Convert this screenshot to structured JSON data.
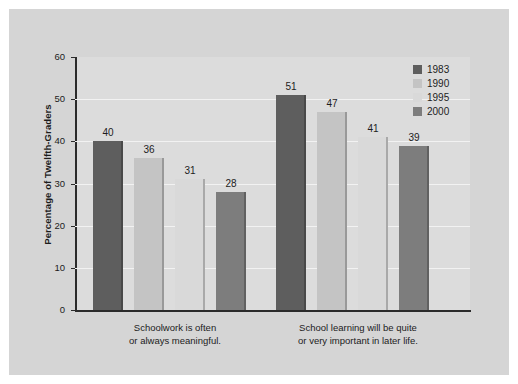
{
  "chart_data": {
    "type": "bar",
    "title": "",
    "subtitle": "",
    "xlabel": "",
    "ylabel": "Percentage of Twelfth-Graders",
    "ylim": [
      0,
      60
    ],
    "ytick_step": 10,
    "ytick_labels": [
      "60",
      "50",
      "40",
      "30",
      "20",
      "10",
      "0"
    ],
    "grid": true,
    "grid_orientation": "horizontal",
    "legend_position": "top-right",
    "categories": [
      "Schoolwork is often or always meaningful.",
      "School learning will be quite or very important in later life."
    ],
    "category_lines": [
      [
        "Schoolwork is often",
        "or always meaningful."
      ],
      [
        "School learning will be quite",
        "or very important in later life."
      ]
    ],
    "series": [
      {
        "name": "1983",
        "color": "#5e5e5e",
        "values": [
          40,
          51
        ]
      },
      {
        "name": "1990",
        "color": "#c4c4c4",
        "values": [
          36,
          47
        ]
      },
      {
        "name": "1995",
        "color": "#d9d9d9",
        "values": [
          31,
          41
        ]
      },
      {
        "name": "2000",
        "color": "#7d7d7d",
        "values": [
          28,
          39
        ]
      }
    ]
  },
  "legend": {
    "items": [
      {
        "label": "1983",
        "color": "#5e5e5e"
      },
      {
        "label": "1990",
        "color": "#c4c4c4"
      },
      {
        "label": "1995",
        "color": "#d9d9d9"
      },
      {
        "label": "2000",
        "color": "#7d7d7d"
      }
    ]
  },
  "axes": {
    "y_title": "Percentage of Twelfth-Graders",
    "y_ticks": [
      "60",
      "50",
      "40",
      "30",
      "20",
      "10",
      "0"
    ]
  },
  "bar_labels": {
    "group1": [
      "40",
      "36",
      "31",
      "28"
    ],
    "group2": [
      "51",
      "47",
      "41",
      "39"
    ]
  },
  "colors": {
    "figure_background": "#d5d5d5",
    "plot_background": "#dcdcdc",
    "gridline": "#f2f2f2",
    "axis": "#2b2b2b",
    "text": "#1c1c1c"
  }
}
